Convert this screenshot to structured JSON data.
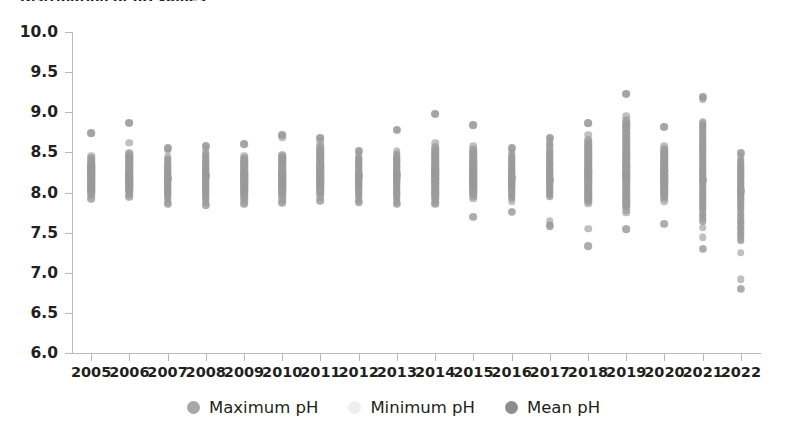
{
  "chart_title": "Distribution of pH values",
  "axes": {
    "y_ticks": [
      "10.0",
      "9.5",
      "9.0",
      "8.5",
      "8.0",
      "7.5",
      "7.0",
      "6.5",
      "6.0"
    ],
    "y_min": 6.0,
    "y_max": 10.0,
    "x_ticks": [
      "2005",
      "2006",
      "2007",
      "2008",
      "2009",
      "2010",
      "2011",
      "2012",
      "2013",
      "2014",
      "2015",
      "2016",
      "2017",
      "2018",
      "2019",
      "2020",
      "2021",
      "2022"
    ]
  },
  "legend": {
    "items": [
      {
        "label": "Maximum pH",
        "color": "#a8a8a8"
      },
      {
        "label": "Minimum pH",
        "color": "#efefef"
      },
      {
        "label": "Mean pH",
        "color": "#8d8d8d"
      }
    ]
  },
  "colors": {
    "dot": "#9a9a9a",
    "axis": "#b9b9b9",
    "text": "#231f20"
  },
  "chart_data": {
    "type": "scatter",
    "title": "Distribution of pH values",
    "xlabel": "",
    "ylabel": "pH",
    "ylim": [
      6.0,
      10.0
    ],
    "y_tick_step": 0.5,
    "grid": false,
    "legend_position": "bottom",
    "x": [
      "2005",
      "2006",
      "2007",
      "2008",
      "2009",
      "2010",
      "2011",
      "2012",
      "2013",
      "2014",
      "2015",
      "2016",
      "2017",
      "2018",
      "2019",
      "2020",
      "2021",
      "2022"
    ],
    "series": [
      {
        "name": "Maximum pH",
        "values": [
          8.74,
          8.87,
          8.55,
          8.58,
          8.6,
          8.72,
          8.68,
          8.52,
          8.78,
          8.98,
          8.84,
          8.55,
          8.68,
          8.86,
          9.23,
          8.82,
          9.19,
          8.49
        ]
      },
      {
        "name": "Minimum pH",
        "values": [
          7.92,
          7.95,
          7.86,
          7.84,
          7.86,
          7.87,
          7.9,
          7.88,
          7.86,
          7.86,
          7.7,
          7.76,
          7.58,
          7.33,
          7.54,
          7.61,
          7.3,
          6.8
        ]
      },
      {
        "name": "Mean pH",
        "values": [
          8.22,
          8.23,
          8.17,
          8.2,
          8.18,
          8.22,
          8.24,
          8.2,
          8.22,
          8.24,
          8.2,
          8.18,
          8.16,
          8.2,
          8.22,
          8.2,
          8.16,
          8.02
        ]
      }
    ],
    "point_clouds": [
      {
        "year": "2005",
        "values": [
          8.74,
          8.46,
          8.43,
          8.4,
          8.36,
          8.33,
          8.3,
          8.27,
          8.24,
          8.22,
          8.19,
          8.16,
          8.13,
          8.1,
          8.07,
          8.05,
          8.02,
          7.99,
          7.96,
          7.93,
          8.28,
          8.25,
          8.21,
          8.17,
          8.14,
          8.09,
          8.04,
          8.0,
          8.35,
          8.31
        ]
      },
      {
        "year": "2006",
        "values": [
          8.87,
          8.62,
          8.49,
          8.45,
          8.42,
          8.39,
          8.36,
          8.33,
          8.3,
          8.27,
          8.24,
          8.21,
          8.18,
          8.15,
          8.12,
          8.09,
          8.06,
          8.03,
          8.0,
          7.97,
          7.95,
          8.26,
          8.22,
          8.19,
          8.16,
          8.13,
          8.1,
          8.07,
          8.04,
          8.44
        ]
      },
      {
        "year": "2007",
        "values": [
          8.55,
          8.52,
          8.36,
          8.33,
          8.3,
          8.27,
          8.24,
          8.21,
          8.18,
          8.15,
          8.12,
          8.09,
          8.06,
          8.03,
          8.0,
          7.97,
          7.94,
          7.91,
          7.88,
          7.86,
          8.26,
          8.22,
          8.19,
          8.16,
          8.12,
          8.08,
          8.04,
          8.01,
          8.4,
          8.44
        ]
      },
      {
        "year": "2008",
        "values": [
          8.58,
          8.54,
          8.49,
          8.45,
          8.41,
          8.38,
          8.35,
          8.32,
          8.29,
          8.26,
          8.23,
          8.2,
          8.17,
          8.14,
          8.11,
          8.08,
          8.05,
          8.02,
          7.99,
          7.96,
          7.93,
          7.9,
          7.87,
          7.84,
          8.3,
          8.25,
          8.21,
          8.16,
          8.12,
          8.07
        ]
      },
      {
        "year": "2009",
        "values": [
          8.6,
          8.46,
          8.43,
          8.4,
          8.37,
          8.34,
          8.31,
          8.28,
          8.25,
          8.22,
          8.19,
          8.16,
          8.13,
          8.1,
          8.07,
          8.04,
          8.01,
          7.98,
          7.95,
          7.92,
          7.89,
          7.86,
          8.24,
          8.2,
          8.17,
          8.14,
          8.1,
          8.06,
          8.02,
          8.35
        ]
      },
      {
        "year": "2010",
        "values": [
          8.72,
          8.69,
          8.47,
          8.44,
          8.41,
          8.38,
          8.35,
          8.32,
          8.29,
          8.26,
          8.23,
          8.2,
          8.17,
          8.14,
          8.11,
          8.08,
          8.05,
          8.02,
          7.99,
          7.96,
          7.93,
          7.9,
          7.87,
          8.25,
          8.21,
          8.18,
          8.15,
          8.11,
          8.07,
          8.43
        ]
      },
      {
        "year": "2011",
        "values": [
          8.68,
          8.64,
          8.58,
          8.53,
          8.49,
          8.45,
          8.42,
          8.39,
          8.36,
          8.33,
          8.3,
          8.27,
          8.24,
          8.21,
          8.18,
          8.15,
          8.12,
          8.09,
          8.06,
          8.03,
          8.0,
          7.97,
          7.94,
          7.9,
          8.31,
          8.26,
          8.22,
          8.17,
          8.13,
          8.08
        ]
      },
      {
        "year": "2012",
        "values": [
          8.52,
          8.48,
          8.44,
          8.41,
          8.38,
          8.35,
          8.32,
          8.29,
          8.26,
          8.23,
          8.2,
          8.17,
          8.14,
          8.11,
          8.08,
          8.05,
          8.02,
          7.99,
          7.96,
          7.93,
          7.9,
          7.88,
          8.25,
          8.21,
          8.18,
          8.15,
          8.11,
          8.07,
          8.36,
          8.42
        ]
      },
      {
        "year": "2013",
        "values": [
          8.78,
          8.52,
          8.48,
          8.45,
          8.42,
          8.39,
          8.36,
          8.33,
          8.3,
          8.27,
          8.24,
          8.21,
          8.18,
          8.15,
          8.12,
          8.09,
          8.06,
          8.03,
          8.0,
          7.97,
          7.94,
          7.91,
          7.88,
          7.86,
          8.26,
          8.22,
          8.19,
          8.15,
          8.11,
          8.4
        ]
      },
      {
        "year": "2014",
        "values": [
          8.98,
          8.62,
          8.57,
          8.52,
          8.48,
          8.45,
          8.42,
          8.39,
          8.36,
          8.33,
          8.3,
          8.27,
          8.24,
          8.21,
          8.18,
          8.15,
          8.12,
          8.09,
          8.06,
          8.03,
          8.0,
          7.97,
          7.94,
          7.91,
          7.88,
          7.86,
          8.28,
          8.23,
          8.17,
          8.11
        ]
      },
      {
        "year": "2015",
        "values": [
          8.84,
          8.58,
          8.54,
          8.5,
          8.46,
          8.43,
          8.4,
          8.37,
          8.34,
          8.31,
          8.28,
          8.25,
          8.22,
          8.19,
          8.16,
          8.13,
          8.1,
          8.07,
          8.04,
          8.01,
          7.98,
          7.95,
          7.92,
          7.7,
          8.26,
          8.21,
          8.17,
          8.12,
          8.08,
          8.35
        ]
      },
      {
        "year": "2016",
        "values": [
          8.55,
          8.51,
          8.47,
          8.43,
          8.4,
          8.37,
          8.34,
          8.31,
          8.28,
          8.25,
          8.22,
          8.19,
          8.16,
          8.13,
          8.1,
          8.07,
          8.04,
          8.01,
          7.98,
          7.95,
          7.92,
          7.89,
          7.76,
          8.26,
          8.22,
          8.18,
          8.14,
          8.09,
          8.05,
          8.36
        ]
      },
      {
        "year": "2017",
        "values": [
          8.68,
          8.64,
          8.6,
          8.5,
          8.46,
          8.43,
          8.4,
          8.37,
          8.34,
          8.31,
          8.28,
          8.25,
          8.22,
          8.19,
          8.16,
          8.13,
          8.1,
          8.07,
          8.04,
          8.01,
          7.98,
          7.95,
          7.64,
          7.6,
          7.58,
          8.26,
          8.21,
          8.16,
          8.11,
          8.35
        ]
      },
      {
        "year": "2018",
        "values": [
          8.86,
          8.72,
          8.66,
          8.6,
          8.55,
          8.5,
          8.46,
          8.43,
          8.4,
          8.37,
          8.34,
          8.31,
          8.28,
          8.25,
          8.22,
          8.19,
          8.16,
          8.13,
          8.1,
          8.07,
          8.04,
          8.01,
          7.98,
          7.95,
          7.92,
          7.89,
          7.86,
          7.55,
          7.33,
          8.28
        ]
      },
      {
        "year": "2019",
        "values": [
          9.23,
          8.95,
          8.9,
          8.85,
          8.8,
          8.74,
          8.68,
          8.62,
          8.56,
          8.5,
          8.45,
          8.4,
          8.35,
          8.3,
          8.25,
          8.2,
          8.15,
          8.1,
          8.05,
          8.0,
          7.95,
          7.9,
          7.86,
          7.82,
          7.78,
          7.75,
          7.54,
          8.42,
          8.33,
          8.22
        ]
      },
      {
        "year": "2020",
        "values": [
          8.82,
          8.58,
          8.54,
          8.5,
          8.46,
          8.43,
          8.4,
          8.37,
          8.34,
          8.31,
          8.28,
          8.25,
          8.22,
          8.19,
          8.16,
          8.13,
          8.1,
          8.07,
          8.04,
          8.01,
          7.98,
          7.95,
          7.92,
          7.89,
          7.61,
          8.26,
          8.21,
          8.16,
          8.11,
          8.35
        ]
      },
      {
        "year": "2021",
        "values": [
          9.19,
          9.16,
          8.88,
          8.84,
          8.8,
          8.75,
          8.7,
          8.65,
          8.6,
          8.55,
          8.5,
          8.45,
          8.4,
          8.35,
          8.3,
          8.25,
          8.2,
          8.15,
          8.1,
          8.05,
          8.0,
          7.95,
          7.9,
          7.85,
          7.8,
          7.72,
          7.64,
          7.56,
          7.44,
          7.3
        ]
      },
      {
        "year": "2022",
        "values": [
          8.49,
          8.45,
          8.41,
          8.37,
          8.33,
          8.29,
          8.25,
          8.21,
          8.17,
          8.13,
          8.09,
          8.05,
          8.01,
          7.97,
          7.93,
          7.89,
          7.85,
          7.8,
          7.72,
          7.64,
          7.56,
          7.48,
          7.4,
          7.25,
          6.92,
          6.8,
          8.2,
          8.12,
          8.04,
          7.96
        ]
      }
    ]
  }
}
